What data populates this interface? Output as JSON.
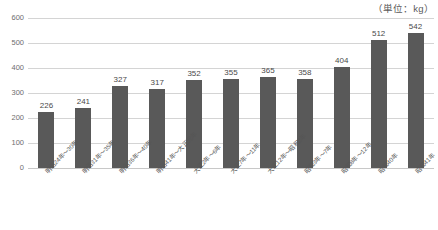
{
  "unit_note": "（単位：kg）",
  "caption": "",
  "colors": {
    "bar": "#595959",
    "gridline": "#d4d4d4",
    "text": "#595959",
    "background": "#ffffff"
  },
  "chart_data": {
    "type": "bar",
    "title": "",
    "subtitle": "",
    "xlabel": "",
    "ylabel": "",
    "unit": "（単位：kg）",
    "ylim": [
      0,
      600
    ],
    "yticks": [
      0,
      100,
      200,
      300,
      400,
      500,
      600
    ],
    "ytick_labels": [
      "0",
      "100",
      "200",
      "300",
      "400",
      "500",
      "600"
    ],
    "grid": true,
    "legend": false,
    "categories": [
      "明治24年～30年",
      "明治31年～35年",
      "明治36年～40年",
      "明治41年～大正元年",
      "大正2年～6年",
      "大正7年～11年",
      "大正12年～昭和2年",
      "昭和3年～7年",
      "昭和8年～12年",
      "昭和40年",
      "昭和41年"
    ],
    "values": [
      226,
      241,
      327,
      317,
      352,
      355,
      365,
      358,
      404,
      512,
      542
    ],
    "data_labels": [
      "226",
      "241",
      "327",
      "317",
      "352",
      "355",
      "365",
      "358",
      "404",
      "512",
      "542"
    ]
  }
}
